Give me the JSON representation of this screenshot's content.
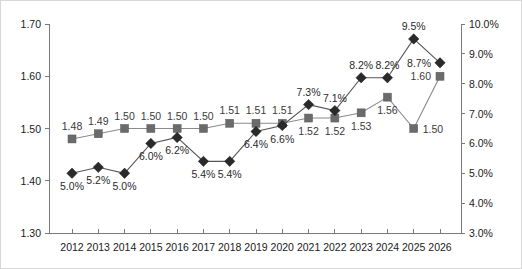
{
  "chart_data": {
    "type": "line",
    "title": "",
    "subtitle": "",
    "xlabel": "",
    "ylabel": "",
    "categories": [
      "2012",
      "2013",
      "2014",
      "2015",
      "2016",
      "2017",
      "2018",
      "2019",
      "2020",
      "2021",
      "2022",
      "2023",
      "2024",
      "2025",
      "2026"
    ],
    "grid": false,
    "legend_position": "none",
    "axes": {
      "left": {
        "ylim": [
          1.3,
          1.7
        ],
        "ticks": [
          1.3,
          1.4,
          1.5,
          1.6,
          1.7
        ],
        "tick_labels": [
          "1.30",
          "1.40",
          "1.50",
          "1.60",
          "1.70"
        ],
        "format": "0.00"
      },
      "right": {
        "ylim": [
          3.0,
          10.0
        ],
        "ticks": [
          3.0,
          4.0,
          5.0,
          6.0,
          7.0,
          8.0,
          9.0,
          10.0
        ],
        "tick_labels": [
          "3.0%",
          "4.0%",
          "5.0%",
          "6.0%",
          "7.0%",
          "8.0%",
          "9.0%",
          "10.0%"
        ],
        "format": "0.0%"
      },
      "x": {
        "tick_labels": [
          "2012",
          "2013",
          "2014",
          "2015",
          "2016",
          "2017",
          "2018",
          "2019",
          "2020",
          "2021",
          "2022",
          "2023",
          "2024",
          "2025",
          "2026"
        ]
      }
    },
    "series": [
      {
        "name": "square-series",
        "axis": "left",
        "marker": "square",
        "color": "#6b6b6b",
        "values": [
          1.48,
          1.49,
          1.5,
          1.5,
          1.5,
          1.5,
          1.51,
          1.51,
          1.51,
          1.52,
          1.52,
          1.53,
          1.56,
          1.5,
          1.6
        ],
        "data_labels": [
          "1.48",
          "1.49",
          "1.50",
          "1.50",
          "1.50",
          "1.50",
          "1.51",
          "1.51",
          "1.51",
          "1.52",
          "1.52",
          "1.53",
          "1.56",
          "1.50",
          "1.60"
        ],
        "label_positions": [
          "above",
          "above",
          "above",
          "above",
          "above",
          "above",
          "above",
          "above",
          "above",
          "below",
          "below",
          "below",
          "below",
          "right",
          "left"
        ]
      },
      {
        "name": "diamond-series",
        "axis": "right",
        "marker": "diamond",
        "color": "#2a2a2a",
        "values": [
          5.0,
          5.2,
          5.0,
          6.0,
          6.2,
          5.4,
          5.4,
          6.4,
          6.6,
          7.3,
          7.1,
          8.2,
          8.2,
          9.5,
          8.7
        ],
        "data_labels": [
          "5.0%",
          "5.2%",
          "5.0%",
          "6.0%",
          "6.2%",
          "5.4%",
          "5.4%",
          "6.4%",
          "6.6%",
          "7.3%",
          "7.1%",
          "8.2%",
          "8.2%",
          "9.5%",
          "8.7%"
        ],
        "label_positions": [
          "below",
          "below",
          "below",
          "below",
          "below",
          "below",
          "below",
          "below",
          "below",
          "above",
          "above",
          "above",
          "above",
          "above",
          "left"
        ]
      }
    ]
  }
}
